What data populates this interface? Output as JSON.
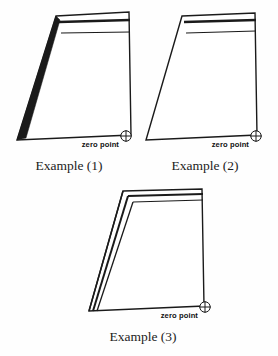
{
  "figure": {
    "background_color": "#fefefe",
    "line_color": "#1a1a1a",
    "width": 278,
    "height": 356
  },
  "examples": [
    {
      "id": "example-1",
      "caption": "Example (1)",
      "zero_point_label": "zero point",
      "zero_point_marker": "circle-plus",
      "edge_style": "tapered-wedge-left",
      "top_line_count": 3,
      "caption_x": 69,
      "caption_y": 170,
      "zero_label_x": 110,
      "zero_label_y": 146,
      "zero_x": 126,
      "zero_y": 136,
      "outline": "M 56,16 L 129,12 L 131,135 L 17,140 Z",
      "wedge": "M 56,16 L 60,20 L 26,138 L 17,140 Z",
      "inner_lines": [
        "M 59,22 L 130,20",
        "M 61,33 L 130,32"
      ],
      "thick_line": "M 59,22 L 130,20"
    },
    {
      "id": "example-2",
      "caption": "Example (2)",
      "zero_point_label": "zero point",
      "zero_point_marker": "circle-plus",
      "edge_style": "single-left",
      "top_line_count": 2,
      "caption_x": 208,
      "caption_y": 170,
      "zero_label_x": 249,
      "zero_label_y": 146,
      "zero_x": 256,
      "zero_y": 136,
      "outline": "M 182,16 L 255,13 L 257,135 L 146,140 Z",
      "wedge": "",
      "inner_lines": [
        "M 184,22 L 256,20",
        "M 186,33 L 256,31"
      ],
      "thick_line": "M 184,22 L 256,20"
    },
    {
      "id": "example-3",
      "caption": "Example (3)",
      "zero_point_label": "zero point",
      "zero_point_marker": "circle-plus",
      "edge_style": "triple-parallel-left",
      "top_line_count": 3,
      "caption_x": 143,
      "caption_y": 341,
      "zero_label_x": 206,
      "zero_label_y": 318,
      "zero_x": 206,
      "zero_y": 307,
      "outline": "M 123,191 L 202,189 L 204,306 L 89,311 Z",
      "wedge": "",
      "inner_lines": [
        "M 128,196 L 203,194",
        "M 133,202 L 203,200"
      ],
      "left_lines": [
        "M 123,191 L 89,311",
        "M 128,196 L 93,311",
        "M 133,202 L 97,311"
      ],
      "thick_line": "M 128,196 L 203,194"
    }
  ]
}
